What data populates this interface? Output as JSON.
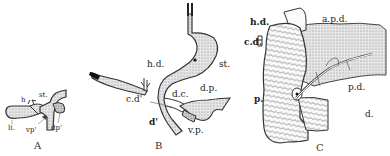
{
  "figures": [
    {
      "id": "A",
      "caption": "A",
      "labels": {
        "st": "st.",
        "hd": "h",
        "li": "li.",
        "vp": "vp'",
        "dp": "dp'"
      }
    },
    {
      "id": "B",
      "caption": "B",
      "labels": {
        "hd": "h.d.",
        "st": "st.",
        "cd": "c.d'",
        "dc": "d.c.",
        "dp": "d.p.",
        "d": "d'",
        "vp": "v.p."
      }
    },
    {
      "id": "C",
      "caption": "C",
      "labels": {
        "hd": "h.d.",
        "cd": "c.d.",
        "apd": "a.p.d.",
        "pd": "p.d.",
        "p": "p.",
        "d": "d."
      }
    }
  ],
  "colors": {
    "ink": "#222222",
    "stipple": "#bdbdbd",
    "background": "#ffffff"
  }
}
